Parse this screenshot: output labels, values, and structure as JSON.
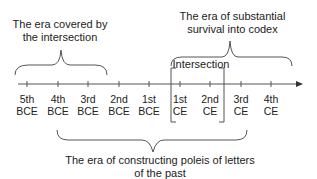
{
  "diagram": {
    "top_left_label": [
      "The era covered by",
      "the intersection"
    ],
    "top_right_label": [
      "The era of substantial",
      "survival into codex"
    ],
    "intersection_label": "Intersection",
    "bottom_label": [
      "The era of constructing poleis of letters",
      "of the past"
    ],
    "ticks": [
      {
        "num": "5th",
        "era": "BCE"
      },
      {
        "num": "4th",
        "era": "BCE"
      },
      {
        "num": "3rd",
        "era": "BCE"
      },
      {
        "num": "2nd",
        "era": "BCE"
      },
      {
        "num": "1st",
        "era": "BCE"
      },
      {
        "num": "1st",
        "era": "CE"
      },
      {
        "num": "2nd",
        "era": "CE"
      },
      {
        "num": "3rd",
        "era": "CE"
      },
      {
        "num": "4th",
        "era": "CE"
      }
    ],
    "line_color": "#555555"
  }
}
